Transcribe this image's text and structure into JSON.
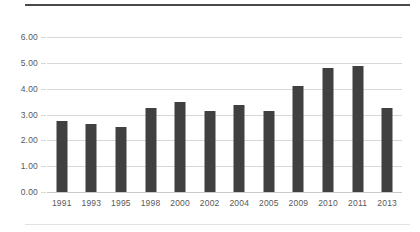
{
  "chart_data": {
    "type": "bar",
    "title": "",
    "subtitle": "",
    "xlabel": "",
    "ylabel": "",
    "categories": [
      "1991",
      "1993",
      "1995",
      "1998",
      "2000",
      "2002",
      "2004",
      "2005",
      "2009",
      "2010",
      "2011",
      "2013"
    ],
    "values": [
      2.75,
      2.63,
      2.52,
      3.24,
      3.5,
      3.14,
      3.35,
      3.14,
      4.1,
      4.8,
      4.88,
      3.27
    ],
    "ylim": [
      0,
      6
    ],
    "ytick_values": [
      0,
      1,
      2,
      3,
      4,
      5,
      6
    ],
    "ytick_labels": [
      "0.00",
      "1.00",
      "2.00",
      "3.00",
      "4.00",
      "5.00",
      "6.00"
    ],
    "grid": true,
    "grid_axis": "y",
    "legend": false,
    "legend_position": "none",
    "bar_color": "#404041",
    "grid_color": "#d8d8d8",
    "text_color": "#58595b",
    "annotations": []
  },
  "decorations": {
    "top_rule_color": "#4a4a4a",
    "bottom_rule_color": "#e2e2e2"
  }
}
